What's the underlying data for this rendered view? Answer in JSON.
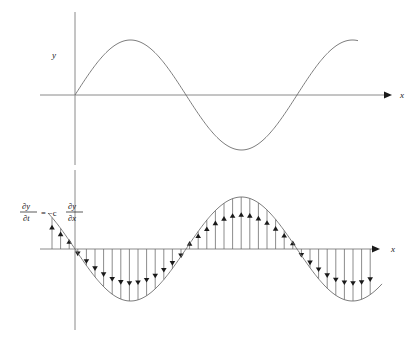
{
  "figure": {
    "title_visible": false,
    "background_color": "#ffffff",
    "curve_color": "#6e6e6e",
    "axis_color": "#8a8a8a",
    "arrow_color": "#1a1a1a"
  },
  "panels": [
    {
      "id": "upper",
      "name": "displacement-panel",
      "y_axis_label": "y",
      "x_axis_label": "x",
      "origin": {
        "x": 75,
        "y": 95
      },
      "x_axis": {
        "x_start": 40,
        "x_end": 392,
        "y": 95
      },
      "y_axis": {
        "y_top": 12,
        "y_bottom": 165,
        "x": 75
      },
      "arrow_tip": {
        "x": 392,
        "y": 95
      },
      "curve": {
        "type": "sine",
        "amplitude": 55,
        "wavelength": 222,
        "phase": 0,
        "x_start": 75,
        "x_end": 358
      }
    },
    {
      "id": "lower",
      "name": "time-derivative-panel",
      "y_axis_label": "",
      "x_axis_label": "x",
      "origin": {
        "x": 75,
        "y": 249
      },
      "x_axis": {
        "x_start": 40,
        "x_end": 380,
        "y": 249
      },
      "y_axis": {
        "y_top": 170,
        "y_bottom": 330,
        "x": 75
      },
      "arrow_tip": {
        "x": 380,
        "y": 249
      },
      "curve": {
        "type": "sine",
        "amplitude": 52,
        "wavelength": 222,
        "phase": 3.14159265,
        "x_start": 48,
        "x_end": 382
      },
      "vectors": {
        "count": 38,
        "x_start": 52,
        "x_spacing": 8.6,
        "description": "vertical arrows from axis to curve showing partial-y partial-t"
      },
      "equation": {
        "numerator_left": "∂y",
        "denominator_left": "∂t",
        "relation": "= −c",
        "numerator_right": "∂y",
        "denominator_right": "∂x",
        "position": {
          "x": 22,
          "y": 212
        }
      }
    }
  ],
  "chart_data": {
    "type": "line",
    "title": "",
    "xlabel": "x",
    "ylabel": "y",
    "grid": false,
    "legend": null,
    "series": [
      {
        "name": "y (displacement)",
        "panel": "upper",
        "function": "y = A sin(2*pi*x / lambda)",
        "amplitude": 55,
        "wavelength": 222,
        "phase_deg": 0,
        "key_points": [
          {
            "x": 0,
            "y": 0,
            "note": "origin, zero crossing rising"
          },
          {
            "x": 55.5,
            "y": 55,
            "note": "crest"
          },
          {
            "x": 111,
            "y": 0,
            "note": "zero crossing falling"
          },
          {
            "x": 166.5,
            "y": -55,
            "note": "trough"
          },
          {
            "x": 222,
            "y": 0,
            "note": "zero crossing rising"
          },
          {
            "x": 283,
            "y": 50,
            "note": "curve end, rising toward crest"
          }
        ]
      },
      {
        "name": "dy/dt = -c dy/dx",
        "panel": "lower",
        "function": "y = -A sin(2*pi*x / lambda)",
        "amplitude": 52,
        "wavelength": 222,
        "phase_deg": 180,
        "key_points": [
          {
            "x": -27,
            "y": 0,
            "note": "curve start left of axis"
          },
          {
            "x": 0,
            "y": -30,
            "note": "value at y-axis, negative"
          },
          {
            "x": 55.5,
            "y": -52,
            "note": "trough"
          },
          {
            "x": 111,
            "y": 0,
            "note": "zero crossing rising"
          },
          {
            "x": 166.5,
            "y": 52,
            "note": "crest"
          },
          {
            "x": 222,
            "y": 0,
            "note": "zero crossing falling"
          },
          {
            "x": 277,
            "y": -52,
            "note": "trough"
          },
          {
            "x": 307,
            "y": 45,
            "note": "curve end rising"
          }
        ]
      }
    ],
    "annotations": [
      {
        "text": "∂y/∂t = −c ∂y/∂x",
        "x": 22,
        "y": 212,
        "panel": "lower"
      },
      {
        "text": "y",
        "x": 52,
        "y": 55,
        "panel": "upper"
      },
      {
        "text": "x",
        "x": 400,
        "y": 95,
        "panel": "upper"
      },
      {
        "text": "x",
        "x": 392,
        "y": 249,
        "panel": "lower"
      }
    ]
  }
}
